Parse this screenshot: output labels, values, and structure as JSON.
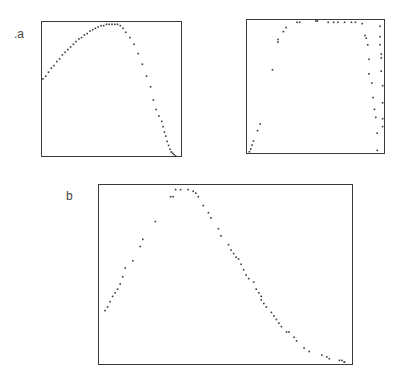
{
  "labels": {
    "a": ".a",
    "b": "b"
  },
  "chart_data": [
    {
      "type": "scatter",
      "panel": "a-left",
      "title": "",
      "xlabel": "",
      "ylabel": "",
      "xlim": [
        0,
        1
      ],
      "ylim": [
        0,
        1
      ],
      "grid": false,
      "x": [
        0.0,
        0.02,
        0.04,
        0.06,
        0.08,
        0.1,
        0.12,
        0.14,
        0.16,
        0.18,
        0.2,
        0.22,
        0.24,
        0.26,
        0.28,
        0.3,
        0.32,
        0.34,
        0.36,
        0.38,
        0.4,
        0.42,
        0.44,
        0.46,
        0.48,
        0.5,
        0.52,
        0.54,
        0.56,
        0.58,
        0.6,
        0.63,
        0.66,
        0.69,
        0.72,
        0.75,
        0.78,
        0.8,
        0.82,
        0.84,
        0.86,
        0.87,
        0.88,
        0.89,
        0.9,
        0.91,
        0.92,
        0.93,
        0.94,
        0.95,
        0.96
      ],
      "y": [
        0.58,
        0.6,
        0.63,
        0.66,
        0.68,
        0.71,
        0.73,
        0.76,
        0.78,
        0.8,
        0.82,
        0.84,
        0.86,
        0.88,
        0.89,
        0.91,
        0.92,
        0.94,
        0.95,
        0.96,
        0.97,
        0.98,
        0.98,
        0.99,
        0.99,
        0.99,
        0.99,
        0.99,
        0.98,
        0.96,
        0.93,
        0.89,
        0.84,
        0.77,
        0.69,
        0.6,
        0.52,
        0.42,
        0.35,
        0.3,
        0.26,
        0.22,
        0.18,
        0.15,
        0.11,
        0.08,
        0.05,
        0.03,
        0.02,
        0.01,
        0.0
      ]
    },
    {
      "type": "scatter",
      "panel": "a-right",
      "title": "",
      "xlabel": "",
      "ylabel": "",
      "xlim": [
        0,
        1
      ],
      "ylim": [
        0,
        1
      ],
      "grid": false,
      "x": [
        0.01,
        0.02,
        0.03,
        0.04,
        0.07,
        0.09,
        0.18,
        0.22,
        0.22,
        0.26,
        0.28,
        0.36,
        0.38,
        0.5,
        0.51,
        0.59,
        0.63,
        0.66,
        0.71,
        0.76,
        0.79,
        0.84,
        0.86,
        0.87,
        0.88,
        0.89,
        0.89,
        0.91,
        0.92,
        0.93,
        0.94,
        0.95,
        0.95,
        0.97,
        0.97,
        0.97,
        0.98,
        0.98,
        0.98,
        0.99,
        0.99,
        0.99,
        0.99
      ],
      "y": [
        0.01,
        0.03,
        0.06,
        0.09,
        0.17,
        0.22,
        0.63,
        0.84,
        0.86,
        0.92,
        0.95,
        0.99,
        0.99,
        1.0,
        1.0,
        0.99,
        0.99,
        0.99,
        0.99,
        0.99,
        0.99,
        0.98,
        0.89,
        0.87,
        0.82,
        0.71,
        0.6,
        0.53,
        0.42,
        0.33,
        0.27,
        0.15,
        0.02,
        0.96,
        0.88,
        0.82,
        0.75,
        0.72,
        0.62,
        0.51,
        0.38,
        0.26,
        0.2
      ]
    },
    {
      "type": "scatter",
      "panel": "b",
      "title": "",
      "xlabel": "",
      "ylabel": "",
      "xlim": [
        0,
        1
      ],
      "ylim": [
        0,
        1
      ],
      "grid": false,
      "x": [
        0.02,
        0.03,
        0.04,
        0.05,
        0.06,
        0.07,
        0.08,
        0.09,
        0.1,
        0.13,
        0.16,
        0.17,
        0.22,
        0.28,
        0.29,
        0.3,
        0.32,
        0.35,
        0.37,
        0.38,
        0.39,
        0.41,
        0.43,
        0.44,
        0.47,
        0.48,
        0.51,
        0.52,
        0.53,
        0.54,
        0.55,
        0.56,
        0.57,
        0.58,
        0.59,
        0.61,
        0.62,
        0.63,
        0.64,
        0.64,
        0.65,
        0.66,
        0.68,
        0.69,
        0.7,
        0.71,
        0.72,
        0.74,
        0.75,
        0.77,
        0.78,
        0.81,
        0.83,
        0.88,
        0.9,
        0.91,
        0.95,
        0.96,
        0.97,
        0.97
      ],
      "y": [
        0.3,
        0.32,
        0.35,
        0.38,
        0.4,
        0.42,
        0.45,
        0.49,
        0.54,
        0.58,
        0.66,
        0.7,
        0.8,
        0.94,
        0.94,
        0.98,
        0.98,
        0.98,
        0.97,
        0.96,
        0.94,
        0.89,
        0.85,
        0.82,
        0.76,
        0.72,
        0.67,
        0.64,
        0.62,
        0.6,
        0.59,
        0.56,
        0.53,
        0.5,
        0.48,
        0.46,
        0.42,
        0.4,
        0.38,
        0.36,
        0.34,
        0.32,
        0.29,
        0.27,
        0.25,
        0.23,
        0.21,
        0.18,
        0.18,
        0.15,
        0.13,
        0.09,
        0.07,
        0.05,
        0.04,
        0.03,
        0.02,
        0.02,
        0.01,
        0.01
      ]
    }
  ]
}
